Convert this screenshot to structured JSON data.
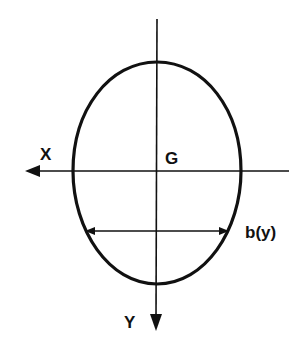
{
  "diagram": {
    "type": "cross-section",
    "labels": {
      "x_axis": "X",
      "y_axis": "Y",
      "centroid": "G",
      "width": "b(y)"
    },
    "colors": {
      "stroke": "#111111",
      "background": "#ffffff"
    }
  }
}
